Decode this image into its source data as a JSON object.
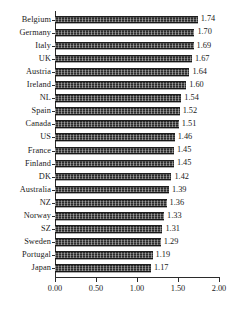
{
  "chart_data": {
    "type": "bar",
    "orientation": "horizontal",
    "title": "",
    "subtitle": "",
    "xlabel": "",
    "ylabel": "",
    "xlim": [
      0.0,
      2.0
    ],
    "xticks": [
      "0.00",
      "0.50",
      "1.00",
      "1.50",
      "2.00"
    ],
    "xtick_values": [
      0.0,
      0.5,
      1.0,
      1.5,
      2.0
    ],
    "grid": false,
    "legend": null,
    "bar_color": "#2b2b2b",
    "categories": [
      "Belgium",
      "Germany",
      "Italy",
      "UK",
      "Austria",
      "Ireland",
      "NL",
      "Spain",
      "Canada",
      "US",
      "France",
      "Finland",
      "DK",
      "Australia",
      "NZ",
      "Norway",
      "SZ",
      "Sweden",
      "Portugal",
      "Japan"
    ],
    "values": [
      1.74,
      1.7,
      1.69,
      1.67,
      1.64,
      1.6,
      1.54,
      1.52,
      1.51,
      1.46,
      1.45,
      1.45,
      1.42,
      1.39,
      1.36,
      1.33,
      1.31,
      1.29,
      1.19,
      1.17
    ],
    "data_labels": [
      "1.74",
      "1.70",
      "1.69",
      "1.67",
      "1.64",
      "1.60",
      "1.54",
      "1.52",
      "1.51",
      "1.46",
      "1.45",
      "1.45",
      "1.42",
      "1.39",
      "1.36",
      "1.33",
      "1.31",
      "1.29",
      "1.19",
      "1.17"
    ]
  }
}
